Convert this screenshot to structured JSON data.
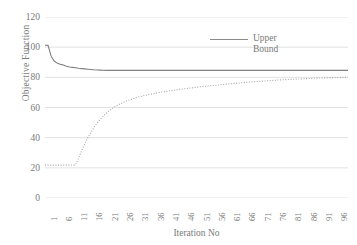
{
  "chart_data": {
    "type": "line",
    "title": "",
    "xlabel": "Iteration No",
    "ylabel": "Objective Function",
    "xlim": [
      1,
      100
    ],
    "ylim": [
      0,
      120
    ],
    "grid": true,
    "grid_axis": "y",
    "legend_position": "top-right",
    "y_ticks": [
      0,
      20,
      40,
      60,
      80,
      100,
      120
    ],
    "x_ticks": [
      1,
      6,
      11,
      16,
      21,
      26,
      31,
      36,
      41,
      46,
      51,
      56,
      61,
      66,
      71,
      76,
      81,
      86,
      91,
      96
    ],
    "x": [
      1,
      2,
      3,
      4,
      5,
      6,
      7,
      8,
      9,
      10,
      11,
      12,
      13,
      14,
      15,
      16,
      17,
      18,
      19,
      20,
      21,
      22,
      23,
      24,
      25,
      26,
      27,
      28,
      29,
      30,
      31,
      32,
      33,
      34,
      35,
      36,
      37,
      38,
      39,
      40,
      41,
      42,
      43,
      44,
      45,
      46,
      47,
      48,
      49,
      50,
      51,
      52,
      53,
      54,
      55,
      56,
      57,
      58,
      59,
      60,
      61,
      62,
      63,
      64,
      65,
      66,
      67,
      68,
      69,
      70,
      71,
      72,
      73,
      74,
      75,
      76,
      77,
      78,
      79,
      80,
      81,
      82,
      83,
      84,
      85,
      86,
      87,
      88,
      89,
      90,
      91,
      92,
      93,
      94,
      95,
      96,
      97,
      98,
      99,
      100
    ],
    "series": [
      {
        "name": "Upper Bound",
        "style": "solid",
        "color": "#7f7f7f",
        "values": [
          101.3,
          101.2,
          94.0,
          90.8,
          89.4,
          88.6,
          88.2,
          87.4,
          86.9,
          86.6,
          86.3,
          86.0,
          85.8,
          85.6,
          85.4,
          85.2,
          85.0,
          84.9,
          84.8,
          84.7,
          84.6,
          84.6,
          84.6,
          84.6,
          84.6,
          84.6,
          84.6,
          84.6,
          84.6,
          84.6,
          84.6,
          84.6,
          84.6,
          84.6,
          84.6,
          84.6,
          84.6,
          84.6,
          84.6,
          84.6,
          84.6,
          84.6,
          84.6,
          84.6,
          84.6,
          84.6,
          84.6,
          84.6,
          84.6,
          84.6,
          84.6,
          84.6,
          84.6,
          84.6,
          84.6,
          84.6,
          84.6,
          84.6,
          84.6,
          84.6,
          84.6,
          84.6,
          84.6,
          84.6,
          84.6,
          84.6,
          84.6,
          84.6,
          84.6,
          84.6,
          84.6,
          84.6,
          84.6,
          84.6,
          84.6,
          84.6,
          84.6,
          84.6,
          84.6,
          84.6,
          84.6,
          84.6,
          84.6,
          84.6,
          84.6,
          84.6,
          84.6,
          84.6,
          84.6,
          84.6,
          84.6,
          84.6,
          84.6,
          84.6,
          84.6,
          84.6,
          84.6,
          84.6,
          84.6,
          84.6
        ]
      },
      {
        "name": "Lower Bound",
        "style": "dotted",
        "color": "#a6a6a6",
        "values": [
          21.8,
          21.8,
          21.8,
          21.8,
          21.8,
          21.8,
          21.8,
          21.8,
          21.8,
          21.9,
          22.0,
          26.5,
          31.5,
          36.0,
          40.0,
          43.5,
          46.8,
          49.6,
          52.0,
          54.2,
          56.2,
          57.9,
          59.4,
          60.7,
          61.8,
          62.8,
          63.8,
          64.6,
          65.3,
          66.0,
          66.6,
          67.2,
          67.7,
          68.2,
          68.6,
          69.0,
          69.4,
          69.8,
          70.1,
          70.5,
          70.8,
          71.1,
          71.4,
          71.7,
          72.0,
          72.3,
          72.5,
          72.8,
          73.0,
          73.3,
          73.5,
          73.8,
          74.0,
          74.2,
          74.4,
          74.6,
          74.8,
          75.0,
          75.2,
          75.4,
          75.6,
          75.8,
          76.0,
          76.2,
          76.3,
          76.5,
          76.7,
          76.9,
          77.0,
          77.2,
          77.3,
          77.5,
          77.6,
          77.8,
          77.9,
          78.0,
          78.2,
          78.3,
          78.4,
          78.5,
          78.6,
          78.7,
          78.8,
          78.9,
          79.0,
          79.1,
          79.2,
          79.3,
          79.4,
          79.5,
          79.6,
          79.6,
          79.7,
          79.8,
          79.8,
          79.9,
          79.9,
          80.0,
          80.0,
          80.1
        ]
      }
    ]
  },
  "legend": {
    "entries": [
      {
        "label": "Upper Bound"
      }
    ]
  },
  "axes": {
    "y_title": "Objective Function",
    "x_title": "Iteration No"
  }
}
